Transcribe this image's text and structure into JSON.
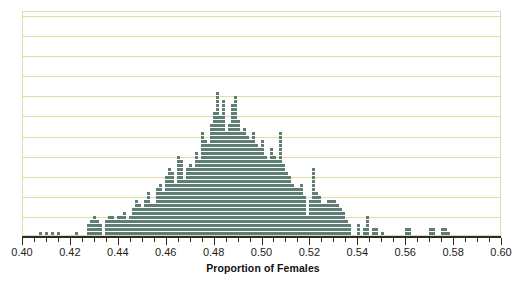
{
  "figure": {
    "clipped_title": "Sampling Distribution of Proportion",
    "background_color": "#ffffff",
    "frame_color": "#e2dca8",
    "grid_color": "#e3dc9c",
    "dot_color": "#5e7d74",
    "axis_color": "#2b2b2b"
  },
  "axis": {
    "title": "Proportion of Females",
    "tick_labels": [
      "0.40",
      "0.42",
      "0.44",
      "0.46",
      "0.48",
      "0.50",
      "0.52",
      "0.54",
      "0.56",
      "0.58",
      "0.60"
    ],
    "tick_values": [
      0.4,
      0.42,
      0.44,
      0.46,
      0.48,
      0.5,
      0.52,
      0.54,
      0.56,
      0.58,
      0.6
    ],
    "minor_tick_step": 0.005,
    "range": [
      0.4,
      0.6
    ]
  },
  "chart_data": {
    "type": "bar",
    "subtype": "dotplot",
    "title": "",
    "xlabel": "Proportion of Females",
    "ylabel": "",
    "xlim": [
      0.4,
      0.6
    ],
    "ylim": [
      0,
      56
    ],
    "grid": true,
    "grid_y_step": 5,
    "legend": "none",
    "dot_unit": 1,
    "bin_width": 0.00125,
    "note": "Stacked dot plot of simulated sample proportions; each dot is one sample.",
    "x": [
      0.4075,
      0.41,
      0.4125,
      0.415,
      0.4225,
      0.4275,
      0.4288,
      0.43,
      0.4313,
      0.4325,
      0.435,
      0.4363,
      0.4375,
      0.4388,
      0.44,
      0.4413,
      0.4425,
      0.4438,
      0.445,
      0.4463,
      0.4475,
      0.4488,
      0.45,
      0.4513,
      0.4525,
      0.4538,
      0.455,
      0.4563,
      0.4575,
      0.4588,
      0.46,
      0.4613,
      0.4625,
      0.4638,
      0.465,
      0.4663,
      0.4675,
      0.4688,
      0.47,
      0.4713,
      0.4725,
      0.4738,
      0.475,
      0.4763,
      0.4775,
      0.4788,
      0.48,
      0.4813,
      0.4825,
      0.4838,
      0.485,
      0.4863,
      0.4875,
      0.4888,
      0.49,
      0.4913,
      0.4925,
      0.4938,
      0.495,
      0.4963,
      0.4975,
      0.4988,
      0.5,
      0.5013,
      0.5025,
      0.5038,
      0.505,
      0.5063,
      0.5075,
      0.5088,
      0.51,
      0.5113,
      0.5125,
      0.5138,
      0.515,
      0.5163,
      0.5175,
      0.5188,
      0.52,
      0.5213,
      0.5225,
      0.5238,
      0.525,
      0.5263,
      0.5275,
      0.5288,
      0.53,
      0.5313,
      0.5325,
      0.5338,
      0.535,
      0.5363,
      0.54,
      0.5425,
      0.5438,
      0.5463,
      0.5475,
      0.55,
      0.56,
      0.5613,
      0.57,
      0.5713,
      0.575,
      0.5763,
      0.5775
    ],
    "counts": [
      1,
      1,
      1,
      1,
      1,
      3,
      4,
      5,
      4,
      3,
      4,
      5,
      5,
      4,
      5,
      5,
      6,
      4,
      5,
      7,
      9,
      8,
      7,
      9,
      11,
      8,
      8,
      12,
      13,
      11,
      15,
      17,
      16,
      13,
      20,
      19,
      14,
      17,
      18,
      17,
      21,
      19,
      26,
      24,
      23,
      28,
      31,
      36,
      30,
      34,
      26,
      28,
      33,
      35,
      29,
      26,
      27,
      25,
      24,
      26,
      23,
      22,
      24,
      20,
      19,
      22,
      20,
      19,
      26,
      18,
      16,
      15,
      13,
      12,
      12,
      13,
      10,
      5,
      9,
      17,
      11,
      10,
      8,
      8,
      9,
      9,
      9,
      8,
      7,
      6,
      4,
      3,
      3,
      2,
      5,
      2,
      2,
      1,
      2,
      2,
      2,
      2,
      2,
      2,
      1
    ]
  }
}
